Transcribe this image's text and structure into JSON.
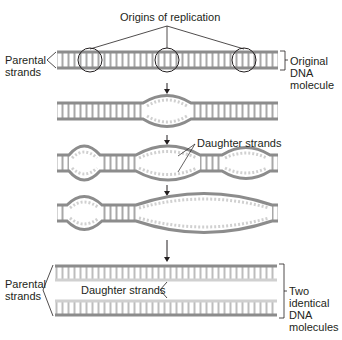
{
  "labels": {
    "origins": "Origins of replication",
    "parental_top_1": "Parental",
    "parental_top_2": "strands",
    "original_1": "Original",
    "original_2": "DNA",
    "original_3": "molecule",
    "daughter_mid": "Daughter strands",
    "parental_bottom_1": "Parental",
    "parental_bottom_2": "strands",
    "daughter_bottom": "Daughter strands",
    "two_1": "Two",
    "two_2": "identical",
    "two_3": "DNA",
    "two_4": "molecules"
  },
  "colors": {
    "parental": "#8c8c8c",
    "daughter": "#cfcfcf",
    "rung": "#a0a0a0",
    "line": "#231f20"
  },
  "stages": [
    {
      "id": "original",
      "y": 60
    },
    {
      "id": "one-bubble",
      "y": 110
    },
    {
      "id": "three-bubbles",
      "y": 163
    },
    {
      "id": "merged-bubbles",
      "y": 213
    },
    {
      "id": "two-molecules",
      "y": 283
    }
  ]
}
